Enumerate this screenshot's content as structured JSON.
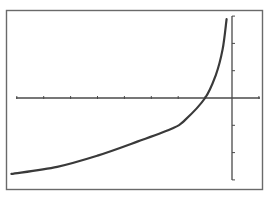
{
  "chart_data": {
    "type": "line",
    "title": "",
    "xlabel": "",
    "ylabel": "",
    "xlim": [
      -8.5,
      1
    ],
    "ylim": [
      -3,
      3
    ],
    "x_ticks": [
      -8,
      -7,
      -6,
      -5,
      -4,
      -3,
      -2,
      -1,
      1
    ],
    "y_ticks": [
      -3,
      -2,
      -1,
      1,
      2,
      3
    ],
    "tick_labels_shown": false,
    "grid": false,
    "legend": null,
    "frame": true,
    "colors": {
      "curve": "#3a3a3a",
      "axes": "#4a4a4a",
      "frame": "#6a6a6a",
      "background": "#ffffff"
    },
    "series": [
      {
        "name": "curve",
        "x": [
          -8.2,
          -6.5,
          -5.0,
          -3.5,
          -2.2,
          -1.75,
          -1.0,
          -0.6,
          -0.35,
          -0.2
        ],
        "y": [
          -2.78,
          -2.52,
          -2.11,
          -1.59,
          -1.11,
          -0.81,
          0.0,
          0.85,
          1.78,
          2.89
        ]
      }
    ]
  },
  "caption": ""
}
